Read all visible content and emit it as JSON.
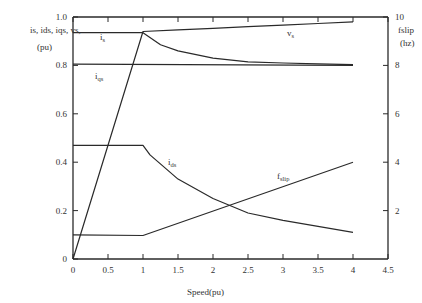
{
  "chart_data": {
    "type": "line",
    "title": "",
    "xlabel": "Speed(pu)",
    "ylabel_left": "is, ids, iqs, vs (pu)",
    "ylabel_right": "fslip (hz)",
    "xlim": [
      0,
      4.5
    ],
    "ylim_left": [
      0,
      1.0
    ],
    "ylim_right": [
      0,
      10
    ],
    "grid": false,
    "x_ticks": [
      "0",
      "0.5",
      "1",
      "1.5",
      "2",
      "2.5",
      "3",
      "3.5",
      "4",
      "4.5"
    ],
    "y_ticks_left": [
      "0",
      "0.2",
      "0.4",
      "0.6",
      "0.8",
      "1.0"
    ],
    "y_ticks_right": [
      "2",
      "4",
      "6",
      "8",
      "10"
    ],
    "series": [
      {
        "name": "vs (constant-V/f ramp)",
        "axis": "left",
        "x": [
          0,
          1.0,
          1.5,
          2.0,
          2.5,
          3.0,
          3.5,
          4.0
        ],
        "y": [
          0,
          0.94,
          0.947,
          0.953,
          0.96,
          0.966,
          0.973,
          0.98
        ]
      },
      {
        "name": "is",
        "axis": "left",
        "x": [
          0,
          1.0,
          1.25,
          1.5,
          2.0,
          2.5,
          3.0,
          3.5,
          4.0
        ],
        "y": [
          0.935,
          0.935,
          0.885,
          0.86,
          0.83,
          0.815,
          0.81,
          0.806,
          0.803
        ]
      },
      {
        "name": "iqs",
        "axis": "left",
        "x": [
          0,
          4.0
        ],
        "y": [
          0.805,
          0.8
        ]
      },
      {
        "name": "ids",
        "axis": "left",
        "x": [
          0,
          1.0,
          1.1,
          1.5,
          2.0,
          2.5,
          3.0,
          3.5,
          4.0
        ],
        "y": [
          0.47,
          0.47,
          0.43,
          0.33,
          0.25,
          0.19,
          0.16,
          0.135,
          0.11
        ]
      },
      {
        "name": "fslip",
        "axis": "right",
        "x": [
          0,
          1.0,
          4.0
        ],
        "y": [
          1.0,
          0.97,
          4.0
        ]
      }
    ],
    "annotations": [
      "is",
      "iqs",
      "vs",
      "ids",
      "fslip"
    ]
  },
  "labels": {
    "ylabel_left_line1": "is, ids, iqs, vs,",
    "ylabel_left_line2": "(pu)",
    "ylabel_right_line1": "fslip",
    "ylabel_right_line2": "(hz)",
    "xlabel": "Speed(pu)",
    "curve_is": "i",
    "curve_is_sub": "s",
    "curve_iqs": "i",
    "curve_iqs_sub": "qs",
    "curve_vs": "v",
    "curve_vs_sub": "s",
    "curve_ids": "i",
    "curve_ids_sub": "ds",
    "curve_fslip": "f",
    "curve_fslip_sub": "slip"
  }
}
